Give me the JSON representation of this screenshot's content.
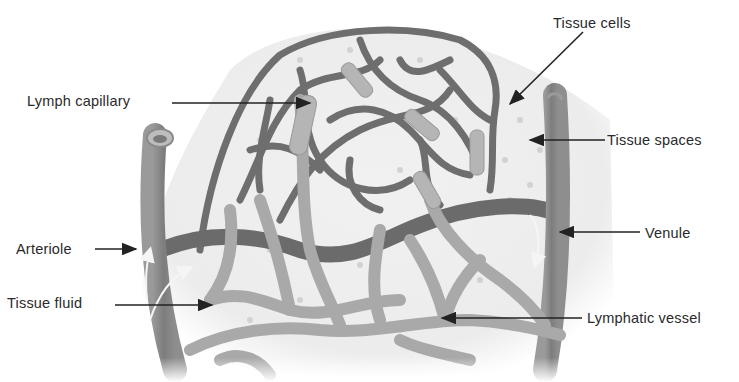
{
  "diagram": {
    "labels": [
      {
        "id": "lymph-capillary",
        "text": "Lymph capillary",
        "x": 27,
        "y": 91
      },
      {
        "id": "tissue-cells",
        "text": "Tissue cells",
        "x": 553,
        "y": 15
      },
      {
        "id": "tissue-spaces",
        "text": "Tissue spaces",
        "x": 606,
        "y": 131
      },
      {
        "id": "arteriole",
        "text": "Arteriole",
        "x": 16,
        "y": 240
      },
      {
        "id": "tissue-fluid",
        "text": "Tissue fluid",
        "x": 7,
        "y": 294
      },
      {
        "id": "venule",
        "text": "Venule",
        "x": 645,
        "y": 224
      },
      {
        "id": "lymphatic-vessel",
        "text": "Lymphatic vessel",
        "x": 586,
        "y": 309
      }
    ],
    "colors": {
      "background": "#ffffff",
      "tissue": "#eeeeee",
      "blood_capillary": "#6e6e6e",
      "lymph_vessel": "#a9a9a9",
      "label_text": "#2a2a2a",
      "arrow": "#222222"
    }
  }
}
